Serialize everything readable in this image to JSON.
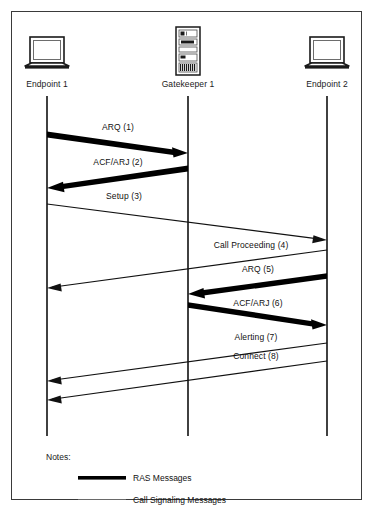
{
  "diagram": {
    "title_visible": false,
    "border_color": "#3a3a3a",
    "background": "#ffffff",
    "line_color": "#111111"
  },
  "nodes": [
    {
      "id": "endpoint1",
      "label": "Endpoint 1",
      "icon": "laptop-icon",
      "x": 47,
      "label_y": 84
    },
    {
      "id": "gatekeeper1",
      "label": "Gatekeeper 1",
      "icon": "server-tower-icon",
      "x": 188,
      "label_y": 84
    },
    {
      "id": "endpoint2",
      "label": "Endpoint 2",
      "icon": "laptop-icon",
      "x": 327,
      "label_y": 84
    }
  ],
  "messages": [
    {
      "seq": 1,
      "label": "ARQ (1)",
      "kind": "ras",
      "from": "endpoint1",
      "to": "gatekeeper1",
      "x1": 47,
      "y1": 134,
      "x2": 188,
      "y2": 153,
      "label_x": 118,
      "label_y": 127
    },
    {
      "seq": 2,
      "label": "ACF/ARJ (2)",
      "kind": "ras",
      "from": "gatekeeper1",
      "to": "endpoint1",
      "x1": 188,
      "y1": 168,
      "x2": 47,
      "y2": 188,
      "label_x": 118,
      "label_y": 162
    },
    {
      "seq": 3,
      "label": "Setup (3)",
      "kind": "call-signaling",
      "from": "endpoint1",
      "to": "endpoint2",
      "x1": 47,
      "y1": 204,
      "x2": 327,
      "y2": 240,
      "label_x": 124,
      "label_y": 196
    },
    {
      "seq": 4,
      "label": "Call Proceeding (4)",
      "kind": "call-signaling",
      "from": "endpoint2",
      "to": "endpoint1",
      "x1": 327,
      "y1": 250,
      "x2": 47,
      "y2": 288,
      "label_x": 251,
      "label_y": 245
    },
    {
      "seq": 5,
      "label": "ARQ (5)",
      "kind": "ras",
      "from": "endpoint2",
      "to": "gatekeeper1",
      "x1": 327,
      "y1": 276,
      "x2": 188,
      "y2": 294,
      "label_x": 258,
      "label_y": 269
    },
    {
      "seq": 6,
      "label": "ACF/ARJ (6)",
      "kind": "ras",
      "from": "gatekeeper1",
      "to": "endpoint2",
      "x1": 188,
      "y1": 305,
      "x2": 327,
      "y2": 325,
      "label_x": 258,
      "label_y": 303
    },
    {
      "seq": 7,
      "label": "Alerting (7)",
      "kind": "call-signaling",
      "from": "endpoint2",
      "to": "endpoint1",
      "x1": 327,
      "y1": 343,
      "x2": 47,
      "y2": 381,
      "label_x": 256,
      "label_y": 337
    },
    {
      "seq": 8,
      "label": "Connect (8)",
      "kind": "call-signaling",
      "from": "endpoint2",
      "to": "endpoint1",
      "x1": 327,
      "y1": 361,
      "x2": 47,
      "y2": 400,
      "label_x": 256,
      "label_y": 356
    }
  ],
  "lifelines": {
    "top": 96,
    "bottom": 436
  },
  "notes": {
    "title": "Notes:",
    "entries": [
      {
        "id": "ras",
        "label": "RAS Messages",
        "style": "thick"
      },
      {
        "id": "call-signaling",
        "label": "Call Signaling Messages",
        "style": "thin"
      }
    ]
  }
}
